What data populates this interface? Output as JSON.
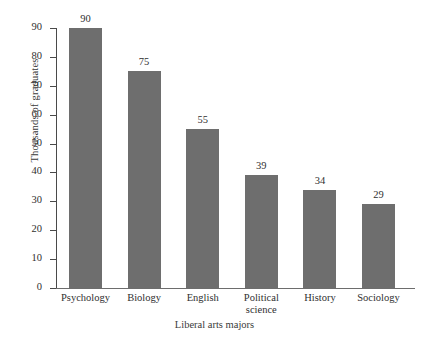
{
  "chart_data": {
    "type": "bar",
    "title": "",
    "xlabel": "Liberal arts majors",
    "ylabel": "Thousands of graduates",
    "categories": [
      "Psychology",
      "Biology",
      "English",
      "Political science",
      "History",
      "Sociology"
    ],
    "values": [
      90,
      75,
      55,
      39,
      34,
      29
    ],
    "value_labels": [
      "90",
      "75",
      "55",
      "39",
      "34",
      "29"
    ],
    "ylim": [
      0,
      90
    ],
    "ytick_labels": [
      "0",
      "10",
      "20",
      "30",
      "40",
      "50",
      "60",
      "70",
      "80",
      "90"
    ],
    "ytick_values": [
      0,
      10,
      20,
      30,
      40,
      50,
      60,
      70,
      80,
      90
    ],
    "grid": false,
    "legend": "none",
    "bar_color": "#6e6e6e",
    "axis_color": "#4a4a4a",
    "text_color": "#2f2f2f"
  }
}
